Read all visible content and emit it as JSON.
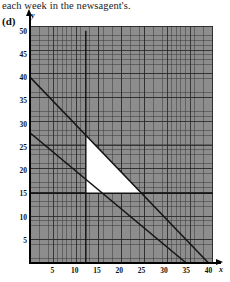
{
  "caption": "each week in the newsagent's.",
  "part_label": "(d)",
  "axis": {
    "y_name": "y",
    "x_name": "x"
  },
  "chart_data": {
    "type": "line",
    "title": "",
    "xlabel": "x",
    "ylabel": "y",
    "xlim": [
      0,
      41
    ],
    "ylim": [
      0,
      51
    ],
    "grid": true,
    "grid_minor_step": 1,
    "grid_major_step": 5,
    "legend": "none",
    "x_ticks": [
      5,
      10,
      15,
      20,
      25,
      30,
      35,
      40
    ],
    "y_ticks": [
      5,
      10,
      15,
      20,
      25,
      30,
      35,
      40,
      45,
      50
    ],
    "series": [
      {
        "name": "x + y = 40",
        "type": "line",
        "x": [
          0,
          40
        ],
        "values": [
          40,
          0
        ]
      },
      {
        "name": "4x + 5y = 140",
        "type": "line",
        "x": [
          0,
          35
        ],
        "values": [
          28,
          0
        ]
      },
      {
        "name": "x = 12.5",
        "type": "vline",
        "x": [
          12.5,
          12.5
        ],
        "values": [
          0,
          50
        ]
      },
      {
        "name": "y = 15",
        "type": "hline",
        "x": [
          0,
          41
        ],
        "values": [
          15,
          15
        ]
      }
    ],
    "shaded_region": {
      "name": "feasible-region",
      "fill": "#ffffff",
      "vertices": [
        [
          12.5,
          27.5
        ],
        [
          12.5,
          15
        ],
        [
          25,
          15
        ]
      ]
    },
    "background_fill": "#8d8d8d"
  },
  "colors": {
    "grid_background": "#8d8d8d",
    "line": "#151515",
    "feasible_fill": "#ffffff",
    "axis": "#000000",
    "text": "#111111"
  },
  "y_tick_labels": [
    "50",
    "45",
    "40",
    "35",
    "30",
    "25",
    "20",
    "15",
    "10",
    "5"
  ],
  "x_tick_labels": [
    "5",
    "10",
    "15",
    "20",
    "25",
    "30",
    "35",
    "40"
  ]
}
